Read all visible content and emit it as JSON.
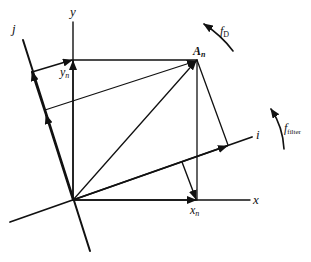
{
  "diagram": {
    "type": "coordinate-rotation",
    "colors": {
      "line": "#111111",
      "background": "#ffffff"
    },
    "axes": {
      "x": {
        "label": "x"
      },
      "y": {
        "label": "y"
      },
      "i": {
        "label": "i"
      },
      "j": {
        "label": "j"
      }
    },
    "points": {
      "vector": {
        "label": "A",
        "subscript": "n"
      },
      "x_proj": {
        "label": "x",
        "subscript": "n"
      },
      "y_proj": {
        "label": "y",
        "subscript": "n"
      }
    },
    "rotations": {
      "doppler": {
        "label": "f",
        "subscript": "D"
      },
      "filter": {
        "label": "f",
        "subscript": "filter"
      }
    }
  }
}
